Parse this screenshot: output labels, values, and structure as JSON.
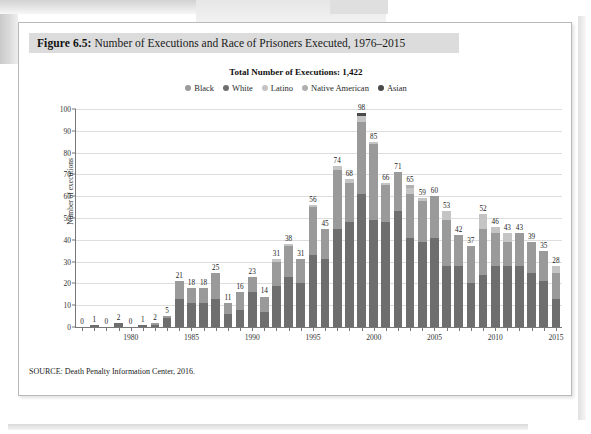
{
  "figure": {
    "caption_number": "Figure 6.5:",
    "caption_text": "Number of Executions and Race of Prisoners Executed, 1976–2015",
    "headline": "Total Number of Executions: 1,422",
    "source": "SOURCE: Death Penalty Information Center, 2016."
  },
  "colors": {
    "black": "#9a9a9a",
    "white": "#6e6e6e",
    "latino": "#c4c4c4",
    "native_american": "#b0b0b0",
    "asian": "#4a4a4a",
    "caption_band": "#dcdcdc",
    "gridline": "#dddddd",
    "axis": "#777777"
  },
  "chart_data": {
    "type": "bar",
    "title": "Total Number of Executions: 1,422",
    "subtitle": "Number of Executions and Race of Prisoners Executed, 1976–2015",
    "xlabel": "",
    "ylabel": "Number of executions",
    "ylim": [
      0,
      100
    ],
    "yticks": [
      0,
      10,
      20,
      30,
      40,
      50,
      60,
      70,
      80,
      90,
      100
    ],
    "grid": true,
    "legend_position": "top",
    "stacked": true,
    "stack_order_bottom_to_top": [
      "White",
      "Black",
      "Latino",
      "Native American",
      "Asian"
    ],
    "legend": [
      "Black",
      "White",
      "Latino",
      "Native American",
      "Asian"
    ],
    "categories": [
      1976,
      1977,
      1978,
      1979,
      1980,
      1981,
      1982,
      1983,
      1984,
      1985,
      1986,
      1987,
      1988,
      1989,
      1990,
      1991,
      1992,
      1993,
      1994,
      1995,
      1996,
      1997,
      1998,
      1999,
      2000,
      2001,
      2002,
      2003,
      2004,
      2005,
      2006,
      2007,
      2008,
      2009,
      2010,
      2011,
      2012,
      2013,
      2014,
      2015
    ],
    "xtick_labels": [
      1980,
      1985,
      1990,
      1995,
      2000,
      2005,
      2010,
      2015
    ],
    "totals": [
      0,
      1,
      0,
      2,
      0,
      1,
      2,
      5,
      21,
      18,
      18,
      25,
      11,
      16,
      23,
      14,
      31,
      38,
      31,
      56,
      45,
      74,
      68,
      98,
      85,
      66,
      71,
      65,
      59,
      60,
      53,
      42,
      37,
      52,
      46,
      43,
      43,
      39,
      35,
      28
    ],
    "series": [
      {
        "name": "White",
        "values": [
          0,
          1,
          0,
          2,
          0,
          1,
          1,
          4,
          13,
          11,
          11,
          13,
          6,
          8,
          16,
          7,
          19,
          23,
          20,
          33,
          31,
          45,
          48,
          61,
          49,
          48,
          53,
          41,
          39,
          41,
          28,
          28,
          20,
          24,
          28,
          28,
          28,
          25,
          21,
          13
        ],
        "color": "#6e6e6e"
      },
      {
        "name": "Black",
        "values": [
          0,
          0,
          0,
          0,
          0,
          0,
          1,
          1,
          8,
          7,
          7,
          12,
          5,
          8,
          7,
          7,
          11,
          14,
          11,
          22,
          14,
          27,
          18,
          33,
          35,
          17,
          18,
          20,
          19,
          19,
          21,
          14,
          17,
          21,
          15,
          11,
          15,
          14,
          14,
          12
        ],
        "color": "#9a9a9a"
      },
      {
        "name": "Latino",
        "values": [
          0,
          0,
          0,
          0,
          0,
          0,
          0,
          0,
          0,
          0,
          0,
          0,
          0,
          0,
          0,
          0,
          1,
          1,
          0,
          1,
          0,
          2,
          2,
          3,
          1,
          1,
          0,
          3,
          1,
          0,
          4,
          0,
          0,
          7,
          3,
          4,
          0,
          0,
          0,
          3
        ],
        "color": "#c4c4c4"
      },
      {
        "name": "Native American",
        "values": [
          0,
          0,
          0,
          0,
          0,
          0,
          0,
          0,
          0,
          0,
          0,
          0,
          0,
          0,
          0,
          0,
          0,
          0,
          0,
          0,
          0,
          0,
          0,
          0,
          0,
          0,
          0,
          1,
          0,
          0,
          0,
          0,
          0,
          0,
          0,
          0,
          0,
          0,
          0,
          0
        ],
        "color": "#b0b0b0"
      },
      {
        "name": "Asian",
        "values": [
          0,
          0,
          0,
          0,
          0,
          0,
          0,
          0,
          0,
          0,
          0,
          0,
          0,
          0,
          0,
          0,
          0,
          0,
          0,
          0,
          0,
          0,
          0,
          1,
          0,
          0,
          0,
          0,
          0,
          0,
          0,
          0,
          0,
          0,
          0,
          0,
          0,
          0,
          0,
          0
        ],
        "color": "#4a4a4a"
      }
    ]
  }
}
